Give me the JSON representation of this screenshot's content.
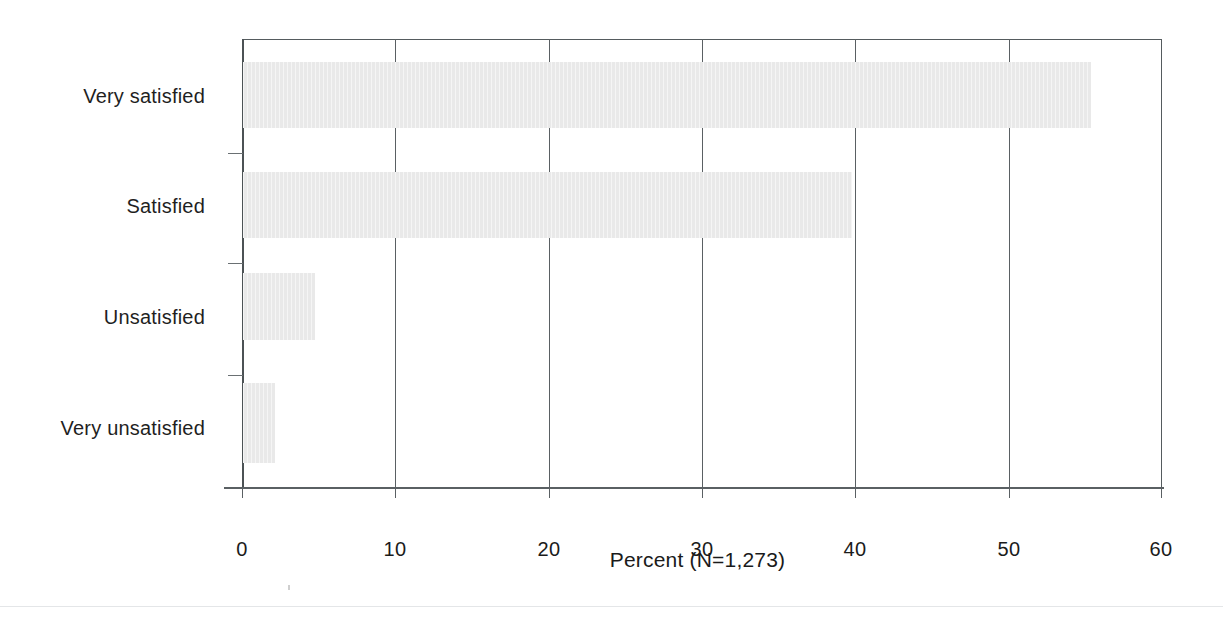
{
  "chart_data": {
    "type": "bar",
    "orientation": "horizontal",
    "title": "",
    "subtitle": "",
    "xlabel": "Percent (N=1,273)",
    "ylabel": "",
    "categories": [
      "Very satisfied",
      "Satisfied",
      "Unsatisfied",
      "Very unsatisfied"
    ],
    "values": [
      55.3,
      39.7,
      4.7,
      2.1
    ],
    "xlim": [
      0,
      60
    ],
    "xticks": [
      0,
      10,
      20,
      30,
      40,
      50,
      60
    ],
    "xticklabels": [
      "0",
      "10",
      "20",
      "30",
      "40",
      "50",
      "60"
    ],
    "grid": "vertical-gridlines-at-xticks",
    "legend": "none",
    "bar_color": "#e9e9e9",
    "axis_color": "#5a6063",
    "text_color": "#1a1a1a",
    "sample_size": "N=1,273"
  },
  "axis": {
    "title": "Percent (N=1,273)"
  },
  "ticks": {
    "t0": "0",
    "t1": "10",
    "t2": "20",
    "t3": "30",
    "t4": "40",
    "t5": "50",
    "t6": "60"
  },
  "categories": {
    "c0": "Very satisfied",
    "c1": "Satisfied",
    "c2": "Unsatisfied",
    "c3": "Very unsatisfied"
  }
}
